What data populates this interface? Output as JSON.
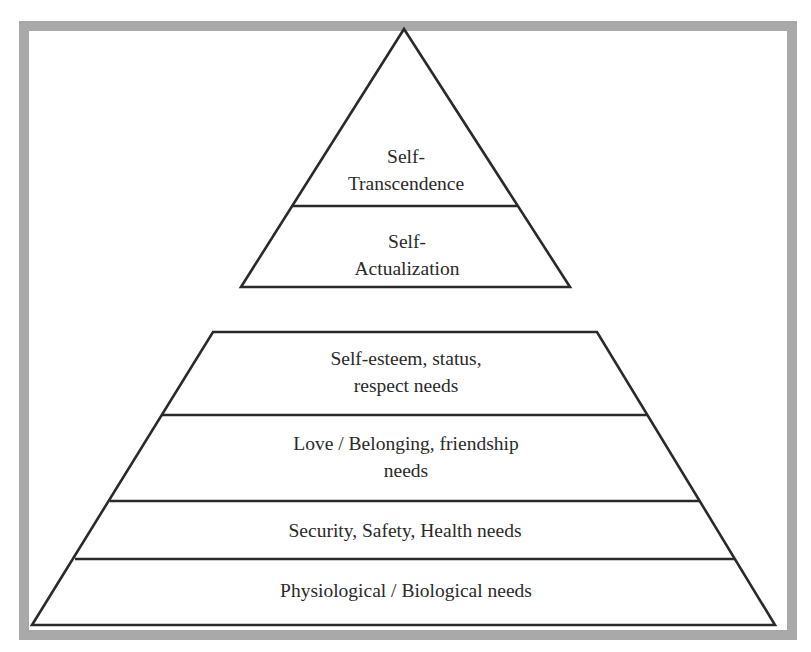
{
  "diagram": {
    "type": "pyramid",
    "colors": {
      "frame": "#a9a9a9",
      "line": "#2a2a2a",
      "text": "#2a2a2a",
      "background": "#ffffff"
    },
    "upper_pyramid": {
      "levels": [
        {
          "line1": "Self-",
          "line2": "Transcendence"
        },
        {
          "line1": "Self-",
          "line2": "Actualization"
        }
      ]
    },
    "lower_pyramid": {
      "levels": [
        {
          "line1": "Self-esteem, status,",
          "line2": "respect needs"
        },
        {
          "line1": "Love / Belonging, friendship",
          "line2": "needs"
        },
        {
          "line1": "Security, Safety, Health needs"
        },
        {
          "line1": "Physiological / Biological needs"
        }
      ]
    }
  }
}
